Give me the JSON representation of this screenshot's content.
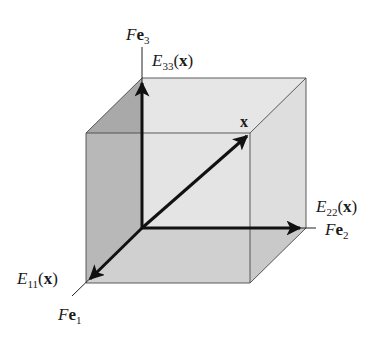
{
  "diagram": {
    "type": "3d-cube-vector-decomposition",
    "colors": {
      "left_face": "#a9a9a9",
      "back_face": "#e3e3e3",
      "bottom_face": "#c9c9c9",
      "right_face": "#dedede",
      "top_face": "#e6e6e6",
      "edge": "#4a4a4a",
      "arrow": "#111111",
      "background": "#ffffff"
    },
    "labels": {
      "fe3": {
        "italic": "F",
        "bold": "e",
        "sub": "3"
      },
      "e33": {
        "italic": "E",
        "sub": "33",
        "paren_open": "(",
        "bold": "x",
        "paren_close": ")"
      },
      "x": {
        "bold": "x"
      },
      "e22": {
        "italic": "E",
        "sub": "22",
        "paren_open": "(",
        "bold": "x",
        "paren_close": ")"
      },
      "fe2": {
        "italic": "F",
        "bold": "e",
        "sub": "2"
      },
      "e11": {
        "italic": "E",
        "sub": "11",
        "paren_open": "(",
        "bold": "x",
        "paren_close": ")"
      },
      "fe1": {
        "italic": "F",
        "bold": "e",
        "sub": "1"
      }
    },
    "vectors": [
      {
        "name": "E33(x)",
        "from": "origin",
        "direction": "Fe3"
      },
      {
        "name": "E22(x)",
        "from": "origin",
        "direction": "Fe2"
      },
      {
        "name": "E11(x)",
        "from": "origin",
        "direction": "Fe1"
      },
      {
        "name": "x",
        "from": "origin",
        "to": "cube-diagonal-corner"
      }
    ]
  }
}
